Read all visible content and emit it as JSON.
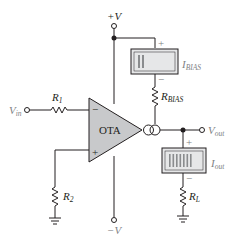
{
  "diagram": {
    "components": {
      "supply_positive": {
        "label": "+V"
      },
      "supply_negative": {
        "label": "−V"
      },
      "input": {
        "label_main": "V",
        "label_sub": "in"
      },
      "output": {
        "label_main": "V",
        "label_sub": "out"
      },
      "r1": {
        "label_main": "R",
        "label_sub": "1"
      },
      "r2": {
        "label_main": "R",
        "label_sub": "2"
      },
      "r_bias": {
        "label_main": "R",
        "label_sub": "BIAS"
      },
      "r_load": {
        "label_main": "R",
        "label_sub": "L"
      },
      "ota": {
        "label": "OTA",
        "inverting": "−",
        "noninverting": "+"
      },
      "meter_bias": {
        "label_main": "I",
        "label_sub": "BIAS",
        "plus": "+",
        "minus": "−",
        "bars": 2
      },
      "meter_out": {
        "label_main": "I",
        "label_sub": "out",
        "plus": "+",
        "minus": "−",
        "bars": 7
      }
    },
    "colors": {
      "wire": "#231f20",
      "ota_fill": "#c8c9cb",
      "meter_fill": "#e6e7e8",
      "meter_bar": "#8a8c8e",
      "label_gray": "#808285"
    }
  }
}
